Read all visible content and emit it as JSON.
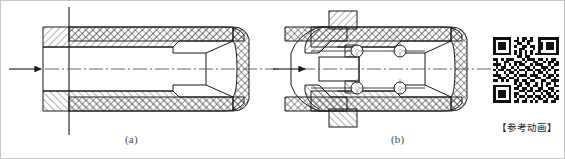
{
  "figure": {
    "background_color": "#ffffff",
    "line_color": "#1a1a1a",
    "hatch_color": "#555555",
    "border_color": "#c8c8c8",
    "captions": [
      {
        "id": "a",
        "label": "(a)",
        "x": 124,
        "y": 132
      },
      {
        "id": "b",
        "label": "(b)",
        "x": 390,
        "y": 132
      }
    ],
    "views": [
      {
        "id": "view-a",
        "caption": "(a)",
        "description": "Longitudinal half-section of a cylindrical sleeve barrel with outer cross-hatched wall, inner diagonally hatched liner and rounded closed right end.",
        "flow_arrow": {
          "direction": "right",
          "x1": 8,
          "y1": 68,
          "x2": 40,
          "y2": 68
        },
        "center_axis": {
          "y": 68,
          "x1": 4,
          "x2": 278,
          "style": "dash-dot"
        },
        "vertical_datum": {
          "x": 68,
          "y1": 6,
          "y2": 134,
          "style": "solid"
        }
      },
      {
        "id": "view-b",
        "caption": "(b)",
        "description": "Longitudinal section of the same barrel fitted with a plunger, flanged collar and four ball/roller elements shown as circles on cross centrelines.",
        "flow_arrow": {
          "direction": "right",
          "x1": 272,
          "y1": 68,
          "x2": 305,
          "y2": 68
        },
        "center_axis": {
          "y": 68,
          "x1": 268,
          "x2": 490,
          "style": "dash-dot"
        },
        "rollers": [
          {
            "cx": 356,
            "cy": 50,
            "r": 6
          },
          {
            "cx": 356,
            "cy": 87,
            "r": 6
          },
          {
            "cx": 399,
            "cy": 50,
            "r": 6
          },
          {
            "cx": 399,
            "cy": 87,
            "r": 6
          }
        ]
      }
    ]
  },
  "qr": {
    "name": "qr-code",
    "label": "【参考动画】",
    "modules": 25,
    "size_px": 66,
    "dark_color": "#111111",
    "light_color": "#ffffff",
    "matrix": [
      "1111111001011010011111111",
      "1000001011010110010000001",
      "1011101001100100011011101",
      "1011101010011011011011101",
      "1011101000110001011011101",
      "1000001010101010010000001",
      "1111111010101010111111111",
      "0000000001101100000000000",
      "1101011100010111011010110",
      "0100110011101001100101101",
      "1110101010110010111001011",
      "0101100101001101001110100",
      "1011011010110110110101011",
      "0100101101001001011010010",
      "1110010010111011100101101",
      "0011101101000100110011010",
      "1101010011011011001100111",
      "0000000010101100101011010",
      "1111111001100101101010011",
      "1000001011011010011001100",
      "1011101000110110110110101",
      "1011101011001001001011010",
      "1011101010110110110101101",
      "1000001001001001011010011",
      "1111111011011010100110110"
    ]
  }
}
